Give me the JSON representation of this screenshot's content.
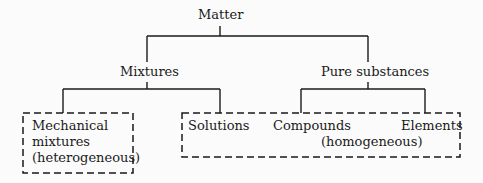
{
  "diagram": {
    "type": "tree",
    "root": "Matter",
    "nodes": {
      "matter": "Matter",
      "mixtures": "Mixtures",
      "pure_substances": "Pure substances",
      "mech_line1": "Mechanical",
      "mech_line2": "mixtures",
      "mech_line3": "(heterogeneous)",
      "solutions": "Solutions",
      "compounds": "Compounds",
      "elements": "Elements",
      "homogeneous": "(homogeneous)"
    },
    "edges": [
      [
        "Matter",
        "Mixtures"
      ],
      [
        "Matter",
        "Pure substances"
      ],
      [
        "Mixtures",
        "Mechanical mixtures (heterogeneous)"
      ],
      [
        "Mixtures",
        "Solutions"
      ],
      [
        "Pure substances",
        "Compounds"
      ],
      [
        "Pure substances",
        "Elements"
      ]
    ],
    "groups": [
      {
        "name": "heterogeneous",
        "members": [
          "Mechanical mixtures"
        ]
      },
      {
        "name": "homogeneous",
        "members": [
          "Solutions",
          "Compounds",
          "Elements"
        ]
      }
    ]
  }
}
